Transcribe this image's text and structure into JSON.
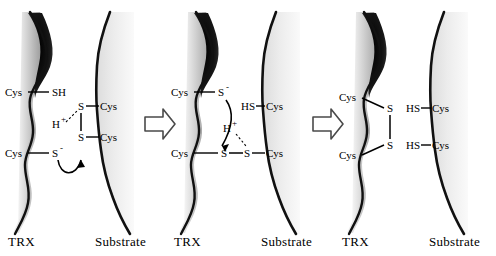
{
  "figure": {
    "background_color": "#ffffff",
    "ink_color": "#000000",
    "substrate_fill": "#e9e9e9",
    "trx_fill": "#bdbdbd",
    "trx_shadow": "#1a1a1a"
  },
  "panels": [
    {
      "id": "panel-1",
      "step": "1",
      "labels": {
        "left_protein": "TRX",
        "right_protein": "Substrate"
      },
      "trx_residues": [
        {
          "name": "Cys",
          "group": "SH",
          "charge": ""
        },
        {
          "name": "Cys",
          "group": "S",
          "charge": "-"
        }
      ],
      "substrate_residues": [
        {
          "group": "S",
          "name": "Cys"
        },
        {
          "group": "S",
          "name": "Cys"
        }
      ],
      "proton": "H",
      "proton_charge": "+",
      "has_curved_arrow": true,
      "has_dashed_hbond": true,
      "substrate_bond": "disulfide"
    },
    {
      "id": "panel-2",
      "step": "2",
      "labels": {
        "left_protein": "TRX",
        "right_protein": "Substrate"
      },
      "trx_residues": [
        {
          "name": "Cys",
          "group": "S",
          "charge": "-"
        },
        {
          "name": "Cys",
          "group": "S",
          "charge": ""
        }
      ],
      "substrate_residues": [
        {
          "group": "HS",
          "name": "Cys"
        },
        {
          "group": "S",
          "name": "Cys"
        }
      ],
      "proton": "H",
      "proton_charge": "+",
      "has_curved_arrow": true,
      "has_dashed_hbond": true,
      "substrate_bond": "mixed-disulfide"
    },
    {
      "id": "panel-3",
      "step": "3",
      "labels": {
        "left_protein": "TRX",
        "right_protein": "Substrate"
      },
      "trx_residues": [
        {
          "name": "Cys",
          "group": "S",
          "charge": ""
        },
        {
          "name": "Cys",
          "group": "S",
          "charge": ""
        }
      ],
      "substrate_residues": [
        {
          "group": "HS",
          "name": "Cys"
        },
        {
          "group": "HS",
          "name": "Cys"
        }
      ],
      "proton": "",
      "proton_charge": "",
      "has_curved_arrow": false,
      "has_dashed_hbond": false,
      "substrate_bond": "reduced-thiols"
    }
  ],
  "separators": [
    {
      "id": "arrow-1",
      "icon": "block-arrow-right-icon"
    },
    {
      "id": "arrow-2",
      "icon": "block-arrow-right-icon"
    }
  ]
}
